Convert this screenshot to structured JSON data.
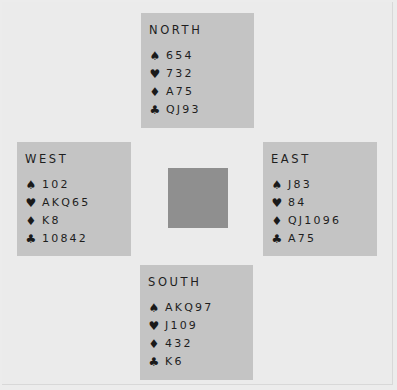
{
  "diagram": {
    "type": "bridge-deal",
    "colors": {
      "background": "#ebebeb",
      "hand_box": "#c4c4c4",
      "table_center": "#8f8f8f",
      "text": "#1e1e1e"
    },
    "suit_icons": {
      "spades": "♠",
      "hearts": "♥",
      "diamonds": "♦",
      "clubs": "♣"
    },
    "hands": {
      "north": {
        "label": "NORTH",
        "spades": "654",
        "hearts": "732",
        "diamonds": "A75",
        "clubs": "QJ93"
      },
      "west": {
        "label": "WEST",
        "spades": "102",
        "hearts": "AKQ65",
        "diamonds": "K8",
        "clubs": "10842"
      },
      "east": {
        "label": "EAST",
        "spades": "J83",
        "hearts": "84",
        "diamonds": "QJ1096",
        "clubs": "A75"
      },
      "south": {
        "label": "SOUTH",
        "spades": "AKQ97",
        "hearts": "J109",
        "diamonds": "432",
        "clubs": "K6"
      }
    }
  }
}
